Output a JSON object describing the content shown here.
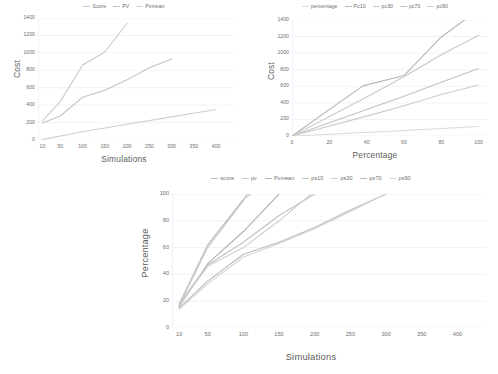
{
  "figure": {
    "background": "#ffffff",
    "text_color": "#5c5c5c",
    "grid_color": "#e8eef4"
  },
  "charts": [
    {
      "id": "chart-1",
      "name": "cost-vs-simulations-chart",
      "chart_data": {
        "type": "line",
        "title": "",
        "xlabel": "Simulations",
        "ylabel": "Cost",
        "xlim": [
          0,
          440
        ],
        "ylim": [
          0,
          1400
        ],
        "xticks": [
          10,
          50,
          100,
          150,
          200,
          250,
          300,
          350,
          400
        ],
        "yticks": [
          0,
          200,
          400,
          600,
          800,
          1000,
          1200,
          1400
        ],
        "grid": "horizontal",
        "legend_position": "top-center",
        "legend": [
          "Score",
          "PV",
          "Pvmean"
        ],
        "colors": [
          "#c9c9c9",
          "#b9c4d0",
          "#d4d4d4"
        ],
        "series": [
          {
            "name": "Score",
            "color": "#c9c9c9",
            "x": [
              10,
              50,
              100,
              150,
              200
            ],
            "y": [
              220,
              440,
              860,
              1010,
              1340
            ]
          },
          {
            "name": "PV",
            "color": "#c2c2c2",
            "x": [
              10,
              50,
              100,
              150,
              200,
              250,
              300
            ],
            "y": [
              195,
              275,
              490,
              570,
              690,
              830,
              930
            ]
          },
          {
            "name": "Pvmean",
            "color": "#cfcfcf",
            "x": [
              10,
              100,
              200,
              300,
              400
            ],
            "y": [
              5,
              95,
              180,
              265,
              350
            ]
          }
        ]
      }
    },
    {
      "id": "chart-2",
      "name": "cost-vs-percentage-chart",
      "chart_data": {
        "type": "line",
        "title": "",
        "xlabel": "Percentage",
        "ylabel": "Cost",
        "xlim": [
          0,
          105
        ],
        "ylim": [
          0,
          1400
        ],
        "xticks": [
          0,
          20,
          40,
          60,
          80,
          100
        ],
        "yticks": [
          0,
          200,
          400,
          600,
          800,
          1000,
          1200,
          1400
        ],
        "grid": "horizontal",
        "legend_position": "top-center",
        "legend": [
          "percentage",
          "Pc10",
          "pc30",
          "pc70",
          "pc90"
        ],
        "colors": [
          "#d8d8d8",
          "#b9b9b9",
          "#cacaca",
          "#c4c4c4",
          "#d0d0d0"
        ],
        "series": [
          {
            "name": "percentage",
            "color": "#dadada",
            "x": [
              0,
              50,
              100
            ],
            "y": [
              0,
              55,
              115
            ]
          },
          {
            "name": "Pc10",
            "color": "#b4b4b4",
            "x": [
              0,
              38,
              60,
              80,
              93
            ],
            "y": [
              0,
              605,
              730,
              1195,
              1410
            ]
          },
          {
            "name": "pc30",
            "color": "#c8c8c8",
            "x": [
              0,
              40,
              60,
              80,
              100
            ],
            "y": [
              0,
              470,
              715,
              980,
              1215
            ]
          },
          {
            "name": "pc70",
            "color": "#c0c0c0",
            "x": [
              0,
              40,
              60,
              80,
              100
            ],
            "y": [
              0,
              320,
              480,
              650,
              815
            ]
          },
          {
            "name": "pc90",
            "color": "#cccccc",
            "x": [
              0,
              40,
              60,
              80,
              100
            ],
            "y": [
              0,
              240,
              365,
              500,
              615
            ]
          }
        ]
      }
    },
    {
      "id": "chart-3",
      "name": "percentage-vs-simulations-chart",
      "chart_data": {
        "type": "line",
        "title": "",
        "xlabel": "Simulations",
        "ylabel": "Percentage",
        "xlim": [
          0,
          440
        ],
        "ylim": [
          0,
          100
        ],
        "xticks": [
          10,
          50,
          100,
          150,
          200,
          250,
          300,
          350,
          400
        ],
        "yticks": [
          0,
          20,
          40,
          60,
          80,
          100
        ],
        "grid": "horizontal",
        "legend_position": "top-center",
        "legend": [
          "score",
          "pv",
          "Pvmean",
          "ps10",
          "ps30",
          "ps70",
          "ps90"
        ],
        "colors": [
          "#bdbdbd",
          "#c8c8c8",
          "#b5b5b5",
          "#c2c2c2",
          "#cfcfcf",
          "#bbbbbb",
          "#d6d6d6"
        ],
        "series": [
          {
            "name": "score",
            "color": "#bdbdbd",
            "x": [
              10,
              50,
              100,
              110
            ],
            "y": [
              18,
              62,
              96,
              100
            ]
          },
          {
            "name": "pv",
            "color": "#c8c8c8",
            "x": [
              10,
              50,
              100,
              105
            ],
            "y": [
              17,
              60,
              95,
              100
            ]
          },
          {
            "name": "Pvmean",
            "color": "#b0b0b0",
            "x": [
              10,
              50,
              100,
              150
            ],
            "y": [
              16,
              48,
              72,
              100
            ]
          },
          {
            "name": "ps10",
            "color": "#c2c2c2",
            "x": [
              10,
              50,
              100,
              150,
              200
            ],
            "y": [
              18,
              47,
              64,
              84,
              100
            ]
          },
          {
            "name": "ps30",
            "color": "#cfcfcf",
            "x": [
              10,
              50,
              100,
              150,
              195
            ],
            "y": [
              17,
              46,
              60,
              80,
              100
            ]
          },
          {
            "name": "ps70",
            "color": "#bbbbbb",
            "x": [
              10,
              50,
              100,
              150,
              200,
              250,
              300
            ],
            "y": [
              15,
              35,
              55,
              64,
              75,
              88,
              100
            ]
          },
          {
            "name": "ps90",
            "color": "#d6d6d6",
            "x": [
              10,
              50,
              100,
              150,
              200,
              250,
              300
            ],
            "y": [
              14,
              33,
              53,
              63,
              74,
              87,
              100
            ]
          }
        ]
      }
    }
  ]
}
